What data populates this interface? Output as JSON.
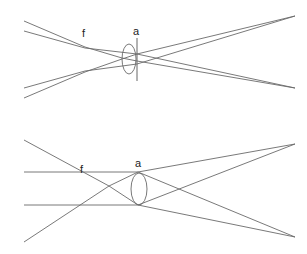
{
  "diagrams": [
    {
      "name": "lens-with-aperture-stop",
      "labels": {
        "focus": "f",
        "aperture": "a"
      }
    },
    {
      "name": "lens-parallel-rays",
      "labels": {
        "focus": "f",
        "aperture": "a"
      }
    }
  ],
  "colors": {
    "line": "#6a6a6a",
    "text": "#222222",
    "background": "#ffffff"
  }
}
